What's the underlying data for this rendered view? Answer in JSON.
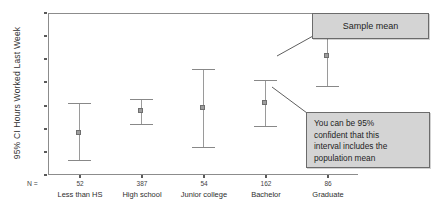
{
  "chart_data": {
    "type": "scatter",
    "title": "",
    "xlabel": "",
    "ylabel": "95% CI Hours Worked Last Week",
    "ylim": [
      40,
      54
    ],
    "ytick_labels": [
      "40",
      "42",
      "44",
      "46",
      "48",
      "50",
      "52",
      "54"
    ],
    "ytick_values": [
      40,
      42,
      44,
      46,
      48,
      50,
      52,
      54
    ],
    "grid": false,
    "legend": "none",
    "n_label": "N =",
    "categories": [
      "Less than HS",
      "High school",
      "Junior college",
      "Bachelor",
      "Graduate"
    ],
    "n_values": [
      "52",
      "387",
      "54",
      "162",
      "86"
    ],
    "series": [
      {
        "name": "Mean hours worked last week",
        "values": [
          43.7,
          45.6,
          45.8,
          46.3,
          50.3
        ],
        "ci_lower": [
          41.3,
          44.4,
          42.4,
          44.2,
          47.7
        ],
        "ci_upper": [
          46.2,
          46.6,
          49.2,
          48.2,
          53.0
        ]
      }
    ]
  },
  "annotations": {
    "sample_mean": {
      "text": "Sample mean"
    },
    "confidence": {
      "lines": [
        "You can be 95%",
        "confident that this",
        "interval includes the",
        "population mean"
      ]
    }
  },
  "colors": {
    "background": "#ffffff",
    "axis": "#8c8c8c",
    "marker": "#9d9d9d",
    "errorbar": "#929292",
    "callout_fill": "#d4d4d4",
    "callout_border": "#6b6b6b",
    "text": "#333333"
  }
}
